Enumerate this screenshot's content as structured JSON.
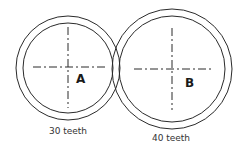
{
  "diagram": {
    "type": "gear-pair",
    "stroke_color": "#2a2a2a",
    "gears": [
      {
        "id": "A",
        "label": "A",
        "caption": "30 teeth",
        "teeth": 30,
        "center": [
          68,
          68
        ],
        "outer_radius": 52,
        "inner_radius": 45
      },
      {
        "id": "B",
        "label": "B",
        "caption": "40 teeth",
        "teeth": 40,
        "center": [
          172,
          69
        ],
        "outer_radius": 60,
        "inner_radius": 53
      }
    ]
  }
}
